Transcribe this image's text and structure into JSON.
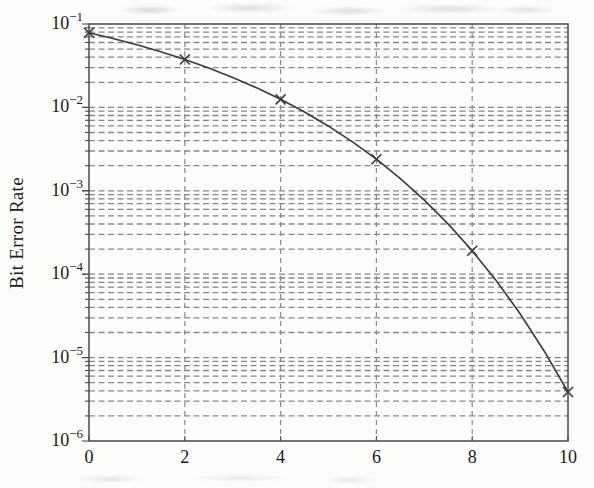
{
  "chart_data": {
    "type": "line",
    "title": "",
    "xlabel": "",
    "ylabel": "Bit Error Rate",
    "xlim": [
      0,
      10
    ],
    "ylim": [
      1e-06,
      0.1
    ],
    "yscale": "log",
    "x_ticks": [
      0,
      2,
      4,
      6,
      8,
      10
    ],
    "y_tick_exponents": [
      -1,
      -2,
      -3,
      -4,
      -5,
      -6
    ],
    "grid": {
      "show": true,
      "style": "dashed",
      "minor_lines": true,
      "color": "#8a8a8a"
    },
    "legend": {
      "show": false
    },
    "line_color": "#3b3b3b",
    "series": [
      {
        "name": "bit-error-rate-curve",
        "marker": "x",
        "x": [
          0,
          0.5,
          1,
          1.5,
          2,
          2.5,
          3,
          3.5,
          4,
          4.5,
          5,
          5.5,
          6,
          6.5,
          7,
          7.5,
          8,
          8.5,
          9,
          9.5,
          10
        ],
        "y": [
          0.0786,
          0.067,
          0.0563,
          0.0465,
          0.0375,
          0.0297,
          0.0229,
          0.0172,
          0.0125,
          0.0088,
          0.00595,
          0.00386,
          0.00239,
          0.0014,
          0.000773,
          0.000399,
          0.000191,
          8.4e-05,
          3.36e-05,
          1.21e-05,
          3.87e-06
        ],
        "marker_x": [
          0,
          2,
          4,
          6,
          8,
          10
        ],
        "marker_y": [
          0.0786,
          0.0375,
          0.0125,
          0.00239,
          0.000191,
          3.87e-06
        ]
      }
    ]
  }
}
